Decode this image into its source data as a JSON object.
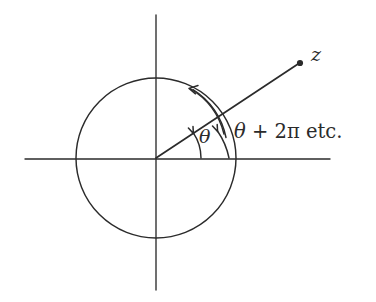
{
  "figure": {
    "name": "complex-argument-diagram",
    "background_color": "#ffffff",
    "ink_color": "#2b2b2b"
  },
  "labels": {
    "point_z": "z",
    "angle_theta": "θ",
    "angle_theta_plus_2pi_italic": "θ",
    "angle_theta_plus_2pi_rest": " + 2π etc.",
    "angle_theta_plus_2pi_full": "θ + 2π etc."
  },
  "geometry": {
    "origin": {
      "x": 156,
      "y": 158
    },
    "circle": {
      "cx": 156,
      "cy": 158,
      "r": 80
    },
    "x_axis": {
      "x1": 25,
      "y1": 159,
      "x2": 330,
      "y2": 159
    },
    "y_axis": {
      "x1": 156,
      "y1": 15,
      "x2": 156,
      "y2": 290
    },
    "ray": {
      "x1": 156,
      "y1": 158,
      "x2": 300,
      "y2": 63
    },
    "point_z_dot": {
      "cx": 300,
      "cy": 63,
      "r": 3.1
    },
    "ray_angle_degrees": 33.4,
    "inner_arc_radius": 45,
    "outer_arc_radius": 73,
    "outer_arc_sweep_degrees": 213
  },
  "arrows": [
    {
      "name": "inner-theta-arrow",
      "x": 196,
      "y": 133,
      "points_to": "ray"
    },
    {
      "name": "outer-arc-arrow-on-ray",
      "x": 229,
      "y": 133,
      "points_to": "ray"
    },
    {
      "name": "outer-arc-arrow-upper-left",
      "x": 193,
      "y": 88,
      "points_to": "counterclockwise"
    }
  ]
}
